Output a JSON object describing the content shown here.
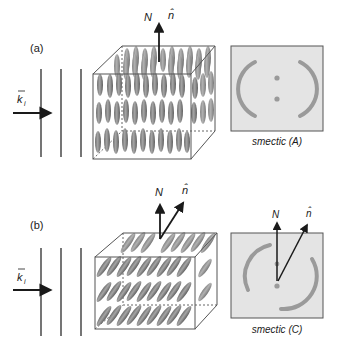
{
  "panels": [
    {
      "id": "a",
      "label": "(a)",
      "wave_vector_label": "k",
      "wave_vector_subscript": "i",
      "normal_label": "N",
      "director_label": "n̂",
      "pattern_caption": "smectic (A)",
      "tilted": false
    },
    {
      "id": "b",
      "label": "(b)",
      "wave_vector_label": "k",
      "wave_vector_subscript": "i",
      "normal_label": "N",
      "director_label": "n̂",
      "pattern_caption": "smectic (C)",
      "tilted": true
    }
  ],
  "colors": {
    "line": "#1a1a1a",
    "box_edge": "#555555",
    "molecule": "#8a8a8a",
    "pattern_bg": "#e4e4e4",
    "pattern_ring": "#9a9a9a"
  }
}
